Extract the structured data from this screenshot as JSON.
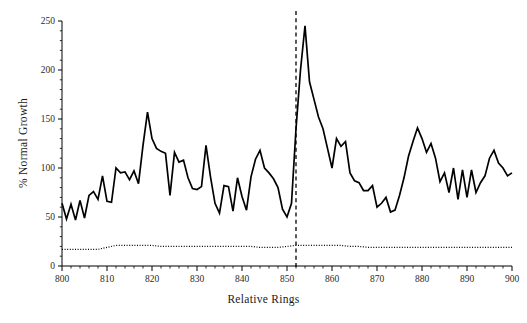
{
  "chart_data": {
    "type": "line",
    "title": "",
    "subtitle": "",
    "xlabel": "Relative Rings",
    "ylabel": "% Normal Growth",
    "xlim": [
      800,
      900
    ],
    "ylim": [
      0,
      250
    ],
    "xticks": [
      800,
      810,
      820,
      830,
      840,
      850,
      860,
      870,
      880,
      890,
      900
    ],
    "xtick_labels": [
      "800",
      "810",
      "820",
      "830",
      "840",
      "850",
      "860",
      "870",
      "880",
      "890",
      "900"
    ],
    "yticks": [
      0,
      50,
      100,
      150,
      200,
      250
    ],
    "ytick_labels": [
      "0",
      "50",
      "100",
      "150",
      "200",
      "250"
    ],
    "xminor_tick_interval": 2,
    "yminor_tick_interval": 10,
    "grid": false,
    "legend": "none",
    "annotations": [
      {
        "name": "event-marker",
        "type": "vline",
        "x": 852,
        "style": "dashed",
        "color": "#000000",
        "label": ""
      }
    ],
    "series": [
      {
        "name": "% Normal Growth",
        "style": "solid",
        "color": "#000000",
        "width": 1.7,
        "x": [
          800,
          801,
          802,
          803,
          804,
          805,
          806,
          807,
          808,
          809,
          810,
          811,
          812,
          813,
          814,
          815,
          816,
          817,
          818,
          819,
          820,
          821,
          822,
          823,
          824,
          825,
          826,
          827,
          828,
          829,
          830,
          831,
          832,
          833,
          834,
          835,
          836,
          837,
          838,
          839,
          840,
          841,
          842,
          843,
          844,
          845,
          846,
          847,
          848,
          849,
          850,
          851,
          852,
          853,
          854,
          855,
          856,
          857,
          858,
          859,
          860,
          861,
          862,
          863,
          864,
          865,
          866,
          867,
          868,
          869,
          870,
          871,
          872,
          873,
          874,
          875,
          876,
          877,
          878,
          879,
          880,
          881,
          882,
          883,
          884,
          885,
          886,
          887,
          888,
          889,
          890,
          891,
          892,
          893,
          894,
          895,
          896,
          897,
          898,
          899,
          900
        ],
        "values": [
          64,
          48,
          63,
          47,
          67,
          49,
          72,
          76,
          68,
          92,
          66,
          65,
          100,
          95,
          96,
          88,
          97,
          84,
          123,
          157,
          130,
          120,
          117,
          115,
          72,
          116,
          106,
          108,
          90,
          79,
          78,
          81,
          123,
          91,
          64,
          54,
          82,
          81,
          56,
          90,
          71,
          57,
          91,
          109,
          118,
          100,
          95,
          89,
          80,
          58,
          50,
          64,
          140,
          200,
          245,
          188,
          170,
          152,
          140,
          120,
          100,
          130,
          122,
          127,
          95,
          87,
          85,
          77,
          77,
          82,
          60,
          64,
          70,
          55,
          57,
          72,
          90,
          112,
          127,
          141,
          130,
          116,
          125,
          110,
          86,
          95,
          75,
          100,
          68,
          98,
          70,
          98,
          75,
          85,
          92,
          110,
          118,
          105,
          100,
          92,
          95
        ]
      },
      {
        "name": "baseline",
        "style": "dotted",
        "color": "#000000",
        "width": 1.2,
        "x": [
          800,
          802,
          804,
          806,
          808,
          810,
          812,
          814,
          816,
          818,
          820,
          822,
          824,
          826,
          828,
          830,
          832,
          834,
          836,
          838,
          840,
          842,
          844,
          846,
          848,
          850,
          852,
          854,
          856,
          858,
          860,
          862,
          864,
          866,
          868,
          870,
          872,
          874,
          876,
          878,
          880,
          882,
          884,
          886,
          888,
          890,
          892,
          894,
          896,
          898,
          900
        ],
        "values": [
          17,
          17,
          17,
          17,
          17,
          19,
          21,
          21,
          21,
          21,
          21,
          20,
          20,
          20,
          20,
          20,
          20,
          20,
          20,
          20,
          20,
          20,
          19,
          19,
          19,
          20,
          21,
          21,
          21,
          21,
          21,
          21,
          20,
          20,
          19,
          19,
          19,
          19,
          19,
          19,
          19,
          19,
          19,
          19,
          19,
          19,
          19,
          19,
          19,
          19,
          19
        ]
      }
    ]
  },
  "axes": {
    "x_title": "Relative Rings",
    "y_title": "% Normal Growth"
  }
}
